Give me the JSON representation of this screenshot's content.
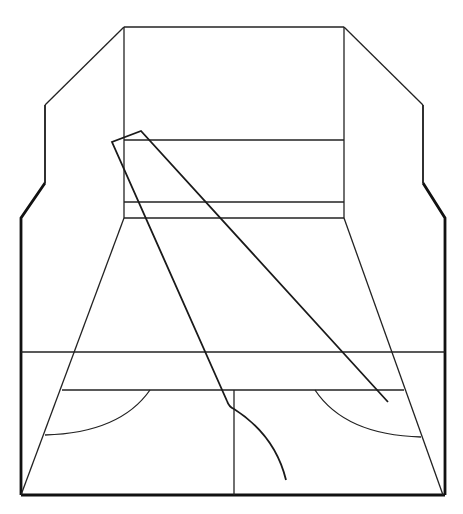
{
  "diagram": {
    "title": "",
    "colors": {
      "stroke": "#111111",
      "background": "#ffffff"
    },
    "elements": [
      "outer-frame",
      "back-wall",
      "floor-perspective-lines",
      "horizontal-bands",
      "center-line",
      "left-arc",
      "right-arc",
      "triangle",
      "curved-tail"
    ]
  }
}
